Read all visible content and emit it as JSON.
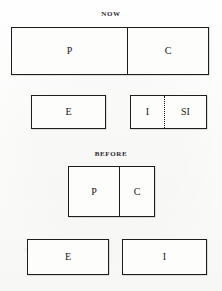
{
  "diagram": {
    "title_now": "NOW",
    "title_before": "BEFORE",
    "sections": [
      {
        "id": "now",
        "label": "NOW",
        "rows": [
          {
            "id": "now-row-pc",
            "cells": [
              {
                "label": "P",
                "divider": "none"
              },
              {
                "label": "C",
                "divider": "solid"
              }
            ]
          },
          {
            "id": "now-row-e",
            "cells": [
              {
                "label": "E",
                "divider": "none"
              }
            ]
          },
          {
            "id": "now-row-i-si",
            "cells": [
              {
                "label": "I",
                "divider": "none"
              },
              {
                "label": "SI",
                "divider": "dotted"
              }
            ]
          }
        ]
      },
      {
        "id": "before",
        "label": "BEFORE",
        "rows": [
          {
            "id": "before-row-pc",
            "cells": [
              {
                "label": "P",
                "divider": "none"
              },
              {
                "label": "C",
                "divider": "solid"
              }
            ]
          },
          {
            "id": "before-row-e",
            "cells": [
              {
                "label": "E",
                "divider": "none"
              }
            ]
          },
          {
            "id": "before-row-i",
            "cells": [
              {
                "label": "I",
                "divider": "none"
              }
            ]
          }
        ]
      }
    ],
    "colors": {
      "ink": "#1d1d1d",
      "paper": "#fdfdfc",
      "text": "#171717"
    }
  }
}
